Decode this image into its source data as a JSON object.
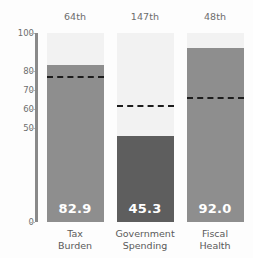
{
  "chart_data": {
    "type": "bar",
    "title": "",
    "subtitle": "",
    "xlabel": "",
    "ylabel": "",
    "ylim": [
      0,
      100
    ],
    "grid": false,
    "legend": "none",
    "categories": [
      "Tax Burden",
      "Government Spending",
      "Fiscal Health"
    ],
    "category_lines": [
      [
        "Tax",
        "Burden"
      ],
      [
        "Government",
        "Spending"
      ],
      [
        "Fiscal",
        "Health"
      ]
    ],
    "values": [
      82.9,
      45.3,
      92.0
    ],
    "value_labels": [
      "82.9",
      "45.3",
      "92.0"
    ],
    "ranks": [
      "64th",
      "147th",
      "48th"
    ],
    "reference_lines": [
      77,
      62,
      66
    ],
    "reference_line_style": "dashed",
    "ytick_values": [
      100,
      80,
      70,
      60,
      50,
      0
    ],
    "ytick_labels": [
      "100",
      "80",
      "70",
      "60",
      "50",
      "0"
    ],
    "bar_colors": [
      "#8e8e8e",
      "#5e5e5e",
      "#8e8e8e"
    ],
    "track_color": "#f2f2f2",
    "axis_color": "#8a8a8a",
    "value_label_color": "#ffffff",
    "reference_line_color": "#1d1d1d"
  }
}
